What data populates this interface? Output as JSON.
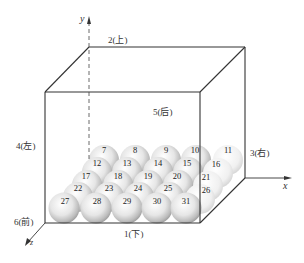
{
  "faces": {
    "bottom": "1(下)",
    "top": "2(上)",
    "right": "3(右)",
    "left": "4(左)",
    "back": "5(后)",
    "front": "6(前)"
  },
  "axes": {
    "x": "x",
    "y": "y",
    "z": "z"
  },
  "spheres": {
    "row1": [
      "7",
      "8",
      "9",
      "10",
      "11"
    ],
    "row2": [
      "12",
      "13",
      "14",
      "15",
      "16"
    ],
    "row3": [
      "17",
      "18",
      "19",
      "20",
      "21"
    ],
    "row4": [
      "22",
      "23",
      "24",
      "25",
      "26"
    ],
    "row5": [
      "27",
      "28",
      "29",
      "30",
      "31"
    ]
  },
  "colors": {
    "line": "#333333",
    "sphere_light": "#ffffff",
    "sphere_dark": "#a8a8a8"
  }
}
